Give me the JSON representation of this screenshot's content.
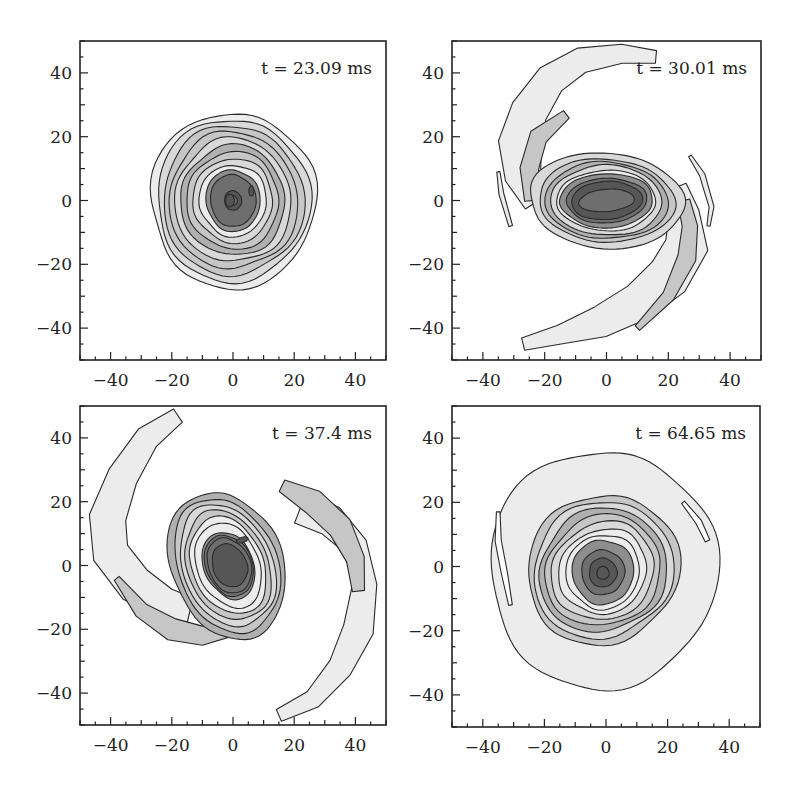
{
  "colors": {
    "frame": "#222222",
    "contour_line": "#2a2a2a",
    "levels": [
      "#ececec",
      "#d9d9d9",
      "#c6c6c6",
      "#b0b0b0",
      "#8e8e8e",
      "#6e6e6e",
      "#565656"
    ]
  },
  "chart_data": [
    {
      "type": "contour",
      "panel": "top-left",
      "title": "t = 23.09 ms",
      "xlabel": "",
      "ylabel": "",
      "xlim": [
        -50,
        50
      ],
      "ylim": [
        -50,
        50
      ],
      "xticks": [
        -40,
        -20,
        0,
        20,
        40
      ],
      "yticks": [
        -40,
        -20,
        0,
        20,
        40
      ],
      "grid": false,
      "shape": "nearly circular nested contours",
      "center": [
        0,
        0
      ],
      "outer_radius": 27,
      "levels": 9
    },
    {
      "type": "contour",
      "panel": "top-right",
      "title": "t = 30.01 ms",
      "xlabel": "",
      "ylabel": "",
      "xlim": [
        -50,
        50
      ],
      "ylim": [
        -50,
        50
      ],
      "xticks": [
        -40,
        -20,
        0,
        20,
        40
      ],
      "yticks": [
        -40,
        -20,
        0,
        20,
        40
      ],
      "grid": false,
      "shape": "elongated bar core with two spiral arms",
      "center": [
        0,
        0
      ],
      "core_half_axes": [
        15,
        9
      ],
      "arm_extent": [
        [
          -27,
          46
        ],
        [
          -27,
          -46
        ]
      ],
      "levels": 9
    },
    {
      "type": "contour",
      "panel": "bottom-left",
      "title": "t = 37.4 ms",
      "xlabel": "",
      "ylabel": "",
      "xlim": [
        -50,
        50
      ],
      "ylim": [
        -50,
        50
      ],
      "xticks": [
        -40,
        -20,
        0,
        20,
        40
      ],
      "yticks": [
        -40,
        -20,
        0,
        20,
        40
      ],
      "grid": false,
      "shape": "tilted oval core with two long trailing spiral arms",
      "center": [
        -3,
        0
      ],
      "core_half_axes": [
        13,
        16
      ],
      "arm_extent": [
        [
          -18,
          47
        ],
        [
          15,
          -47
        ]
      ],
      "levels": 9
    },
    {
      "type": "contour",
      "panel": "bottom-right",
      "title": "t = 64.65 ms",
      "xlabel": "",
      "ylabel": "",
      "xlim": [
        -50,
        50
      ],
      "ylim": [
        -50,
        50
      ],
      "xticks": [
        -40,
        -20,
        0,
        20,
        40
      ],
      "yticks": [
        -40,
        -20,
        0,
        20,
        40
      ],
      "grid": false,
      "shape": "compact round core inside broad diffuse disk with wound arms",
      "center": [
        -1,
        -2
      ],
      "outer_radius": 38,
      "levels": 9
    }
  ]
}
